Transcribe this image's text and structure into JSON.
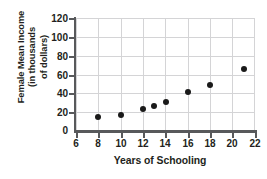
{
  "chart_data": {
    "type": "scatter",
    "title": "",
    "xlabel": "Years of Schooling",
    "ylabel": "Female Mean Income (in thousands of dollars)",
    "ylabel_lines": [
      "Female Mean Income",
      "(in thousands",
      "of dollars)"
    ],
    "x": [
      8,
      10,
      12,
      13,
      14,
      16,
      18,
      21
    ],
    "values": [
      15,
      17,
      23,
      27,
      31,
      41,
      49,
      66
    ],
    "points": [
      {
        "x": 8,
        "y": 15
      },
      {
        "x": 10,
        "y": 17
      },
      {
        "x": 12,
        "y": 23
      },
      {
        "x": 13,
        "y": 27
      },
      {
        "x": 14,
        "y": 31
      },
      {
        "x": 16,
        "y": 41
      },
      {
        "x": 18,
        "y": 49
      },
      {
        "x": 21,
        "y": 66
      }
    ],
    "xlim": [
      6,
      22
    ],
    "ylim": [
      0,
      120
    ],
    "xticks": [
      6,
      8,
      10,
      12,
      14,
      16,
      18,
      20,
      22
    ],
    "yticks": [
      0,
      20,
      40,
      60,
      80,
      100,
      120
    ],
    "xtick_labels": [
      "6",
      "8",
      "10",
      "12",
      "14",
      "16",
      "18",
      "20",
      "22"
    ],
    "ytick_labels": [
      "0",
      "20",
      "40",
      "60",
      "80",
      "100",
      "120"
    ],
    "grid": true,
    "legend": false,
    "colors": {
      "point": "#1a1a1a",
      "grid": "#d4d4d6",
      "axis": "#58595b",
      "text": "#231f20",
      "background": "#ffffff"
    }
  }
}
